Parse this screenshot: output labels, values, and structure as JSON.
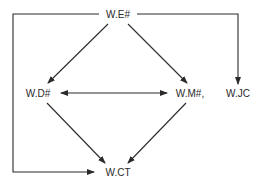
{
  "diagram": {
    "nodes": [
      {
        "id": "WE",
        "label": "W.E#"
      },
      {
        "id": "WD",
        "label": "W.D#"
      },
      {
        "id": "WM",
        "label": "W.M#,"
      },
      {
        "id": "WJC",
        "label": "W.JC"
      },
      {
        "id": "WCT",
        "label": "W.CT"
      }
    ],
    "edges": [
      {
        "from": "WE",
        "to": "WD",
        "type": "directed"
      },
      {
        "from": "WE",
        "to": "WM",
        "type": "directed"
      },
      {
        "from": "WE",
        "to": "WJC",
        "type": "directed",
        "routing": "elbow-right"
      },
      {
        "from": "WE",
        "to": "WCT",
        "type": "directed",
        "routing": "elbow-left"
      },
      {
        "from": "WD",
        "to": "WM",
        "type": "bidirectional"
      },
      {
        "from": "WD",
        "to": "WCT",
        "type": "directed"
      },
      {
        "from": "WM",
        "to": "WCT",
        "type": "directed"
      }
    ],
    "colors": {
      "line": "#2a2a2a",
      "text": "#2a2a2a",
      "background": "#ffffff"
    }
  }
}
